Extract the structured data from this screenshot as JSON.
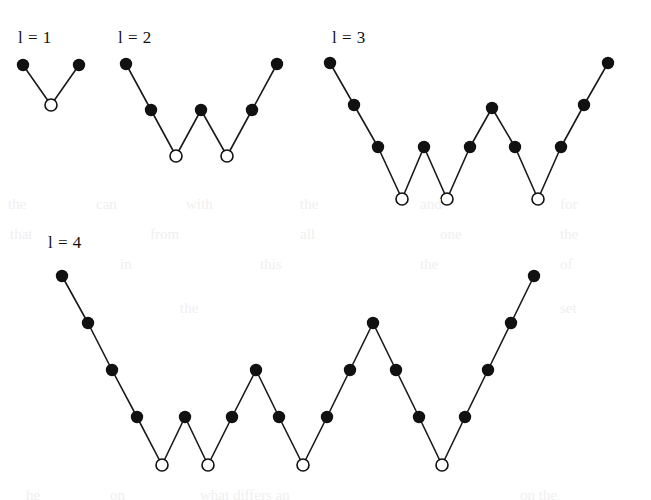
{
  "figure": {
    "background_color": "#ffffff",
    "line_color": "#1a1a1a",
    "filled_node_color": "#111111",
    "hollow_node_fill": "#ffffff",
    "hollow_node_stroke": "#111111",
    "line_width": 1.6,
    "filled_node_radius": 6.2,
    "hollow_node_radius": 6.0,
    "hollow_node_stroke_width": 1.6
  },
  "panels": [
    {
      "id": "panel-l1",
      "label": "l = 1",
      "label_x": 18,
      "label_y": 28,
      "peaks": 1,
      "valleys": 1,
      "step_dx": 28,
      "step_dy": 40,
      "origin_x": 23,
      "origin_y": 65,
      "nodes": [
        {
          "x": 23,
          "y": 65,
          "type": "filled"
        },
        {
          "x": 51,
          "y": 105,
          "type": "hollow"
        },
        {
          "x": 79,
          "y": 65,
          "type": "filled"
        }
      ],
      "node_count": 3
    },
    {
      "id": "panel-l2",
      "label": "l = 2",
      "label_x": 118,
      "label_y": 28,
      "peaks": 2,
      "valleys": 2,
      "step_dx": 25,
      "step_dy": 25,
      "origin_x": 126,
      "origin_y": 64,
      "nodes": [
        {
          "x": 126,
          "y": 64,
          "type": "filled"
        },
        {
          "x": 151,
          "y": 110,
          "type": "filled"
        },
        {
          "x": 176,
          "y": 156,
          "type": "hollow"
        },
        {
          "x": 201,
          "y": 110,
          "type": "filled"
        },
        {
          "x": 227,
          "y": 156,
          "type": "hollow"
        },
        {
          "x": 252,
          "y": 110,
          "type": "filled"
        },
        {
          "x": 277,
          "y": 64,
          "type": "filled"
        }
      ],
      "node_count": 7
    },
    {
      "id": "panel-l3",
      "label": "l = 3",
      "label_x": 332,
      "label_y": 28,
      "peaks": 3,
      "valleys": 3,
      "step_dx": 23,
      "step_dy": 31,
      "origin_x": 330,
      "origin_y": 63,
      "nodes": [
        {
          "x": 330,
          "y": 63,
          "type": "filled"
        },
        {
          "x": 354,
          "y": 105,
          "type": "filled"
        },
        {
          "x": 378,
          "y": 147,
          "type": "filled"
        },
        {
          "x": 402,
          "y": 199,
          "type": "hollow"
        },
        {
          "x": 424,
          "y": 147,
          "type": "filled"
        },
        {
          "x": 447,
          "y": 199,
          "type": "hollow"
        },
        {
          "x": 470,
          "y": 147,
          "type": "filled"
        },
        {
          "x": 492,
          "y": 108,
          "type": "filled"
        },
        {
          "x": 515,
          "y": 147,
          "type": "filled"
        },
        {
          "x": 538,
          "y": 199,
          "type": "hollow"
        },
        {
          "x": 561,
          "y": 147,
          "type": "filled"
        },
        {
          "x": 584,
          "y": 105,
          "type": "filled"
        },
        {
          "x": 608,
          "y": 63,
          "type": "filled"
        }
      ],
      "node_count": 13
    },
    {
      "id": "panel-l4",
      "label": "l = 4",
      "label_x": 48,
      "label_y": 233,
      "peaks": 4,
      "valleys": 4,
      "step_dx": 23,
      "step_dy": 37,
      "origin_x": 62,
      "origin_y": 276,
      "nodes": [
        {
          "x": 62,
          "y": 276,
          "type": "filled"
        },
        {
          "x": 88,
          "y": 323,
          "type": "filled"
        },
        {
          "x": 112,
          "y": 370,
          "type": "filled"
        },
        {
          "x": 137,
          "y": 417,
          "type": "filled"
        },
        {
          "x": 162,
          "y": 465,
          "type": "hollow"
        },
        {
          "x": 185,
          "y": 417,
          "type": "filled"
        },
        {
          "x": 208,
          "y": 465,
          "type": "hollow"
        },
        {
          "x": 232,
          "y": 417,
          "type": "filled"
        },
        {
          "x": 256,
          "y": 370,
          "type": "filled"
        },
        {
          "x": 279,
          "y": 417,
          "type": "filled"
        },
        {
          "x": 303,
          "y": 465,
          "type": "hollow"
        },
        {
          "x": 327,
          "y": 417,
          "type": "filled"
        },
        {
          "x": 350,
          "y": 370,
          "type": "filled"
        },
        {
          "x": 373,
          "y": 323,
          "type": "filled"
        },
        {
          "x": 396,
          "y": 370,
          "type": "filled"
        },
        {
          "x": 419,
          "y": 417,
          "type": "filled"
        },
        {
          "x": 442,
          "y": 465,
          "type": "hollow"
        },
        {
          "x": 465,
          "y": 417,
          "type": "filled"
        },
        {
          "x": 488,
          "y": 370,
          "type": "filled"
        },
        {
          "x": 511,
          "y": 323,
          "type": "filled"
        },
        {
          "x": 534,
          "y": 276,
          "type": "filled"
        }
      ],
      "node_count": 21
    }
  ],
  "background_artifacts": [
    {
      "text": "the",
      "x": 8,
      "y": 196
    },
    {
      "text": "can",
      "x": 96,
      "y": 196
    },
    {
      "text": "with",
      "x": 186,
      "y": 196
    },
    {
      "text": "the",
      "x": 300,
      "y": 196
    },
    {
      "text": "and",
      "x": 420,
      "y": 196
    },
    {
      "text": "for",
      "x": 560,
      "y": 196
    },
    {
      "text": "that",
      "x": 10,
      "y": 226
    },
    {
      "text": "from",
      "x": 150,
      "y": 226
    },
    {
      "text": "all",
      "x": 300,
      "y": 226
    },
    {
      "text": "one",
      "x": 440,
      "y": 226
    },
    {
      "text": "the",
      "x": 560,
      "y": 226
    },
    {
      "text": "in",
      "x": 120,
      "y": 256
    },
    {
      "text": "this",
      "x": 260,
      "y": 256
    },
    {
      "text": "the",
      "x": 420,
      "y": 256
    },
    {
      "text": "of",
      "x": 560,
      "y": 256
    },
    {
      "text": "the",
      "x": 180,
      "y": 300
    },
    {
      "text": "set",
      "x": 560,
      "y": 300
    },
    {
      "text": "he",
      "x": 26,
      "y": 487
    },
    {
      "text": "on",
      "x": 110,
      "y": 487
    },
    {
      "text": "what differs an",
      "x": 200,
      "y": 487
    },
    {
      "text": "on the",
      "x": 520,
      "y": 487
    }
  ]
}
